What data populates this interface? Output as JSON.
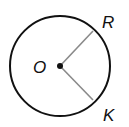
{
  "diagram": {
    "center": {
      "label": "O",
      "x": 60,
      "y": 66
    },
    "radius": 50,
    "points": [
      {
        "label": "R",
        "x": 93,
        "y": 31
      },
      {
        "label": "K",
        "x": 93,
        "y": 100
      }
    ],
    "colors": {
      "circle": "#111111",
      "radius_line": "#8a8a8a"
    }
  }
}
